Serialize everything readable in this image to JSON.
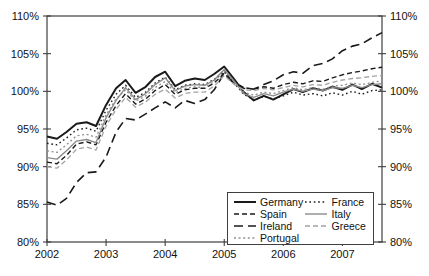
{
  "figure": {
    "width": 429,
    "height": 276,
    "background": "#ffffff"
  },
  "chart_data": {
    "type": "line",
    "title": "",
    "xlabel": "",
    "ylabel": "",
    "grid": false,
    "xlim": [
      2002,
      2007.67
    ],
    "ylim": [
      80,
      110
    ],
    "xticks": {
      "values": [
        2002,
        2003,
        2004,
        2005,
        2006,
        2007
      ],
      "labels": [
        "2002",
        "2003",
        "2004",
        "2005",
        "2006",
        "2007"
      ]
    },
    "yticks": {
      "values": [
        80,
        85,
        90,
        95,
        100,
        105,
        110
      ],
      "labels": [
        "80%",
        "85%",
        "90%",
        "95%",
        "100%",
        "105%",
        "110%"
      ],
      "sides": [
        "left",
        "right"
      ]
    },
    "axis_color": "#3f3f3f",
    "label_color": "#111111",
    "x": [
      2002.0,
      2002.17,
      2002.33,
      2002.5,
      2002.67,
      2002.83,
      2003.0,
      2003.17,
      2003.33,
      2003.5,
      2003.67,
      2003.83,
      2004.0,
      2004.17,
      2004.33,
      2004.5,
      2004.67,
      2004.83,
      2005.0,
      2005.17,
      2005.33,
      2005.5,
      2005.67,
      2005.83,
      2006.0,
      2006.17,
      2006.33,
      2006.5,
      2006.67,
      2006.83,
      2007.0,
      2007.17,
      2007.33,
      2007.5,
      2007.67
    ],
    "series": [
      {
        "name": "Germany",
        "color": "#1a1a1a",
        "dash": "",
        "width": 2.0,
        "values": [
          94.0,
          93.7,
          94.6,
          95.7,
          95.9,
          95.4,
          98.2,
          100.4,
          101.5,
          99.8,
          100.6,
          101.9,
          102.6,
          100.7,
          101.4,
          101.7,
          101.5,
          102.3,
          103.3,
          101.6,
          99.9,
          98.8,
          99.4,
          98.9,
          99.6,
          100.3,
          99.9,
          100.4,
          100.1,
          100.6,
          100.2,
          100.9,
          100.3,
          101.0,
          100.5
        ]
      },
      {
        "name": "Spain",
        "color": "#1a1a1a",
        "dash": "5,3",
        "width": 1.4,
        "values": [
          90.6,
          90.4,
          91.5,
          93.0,
          93.3,
          92.9,
          95.9,
          98.1,
          99.7,
          98.3,
          99.0,
          100.1,
          100.9,
          99.6,
          100.2,
          100.4,
          100.4,
          101.1,
          102.4,
          101.2,
          100.5,
          100.3,
          100.6,
          100.4,
          100.9,
          101.2,
          101.0,
          101.4,
          101.3,
          101.8,
          102.2,
          102.5,
          102.7,
          103.0,
          103.2
        ]
      },
      {
        "name": "Ireland",
        "color": "#1a1a1a",
        "dash": "9,5",
        "width": 1.6,
        "values": [
          85.3,
          84.9,
          85.8,
          87.9,
          89.2,
          89.3,
          91.3,
          94.6,
          96.4,
          96.2,
          97.0,
          97.8,
          98.6,
          97.8,
          98.8,
          98.4,
          98.9,
          100.2,
          102.4,
          101.0,
          100.4,
          100.3,
          100.9,
          101.4,
          102.2,
          102.6,
          102.4,
          103.4,
          103.7,
          104.3,
          105.4,
          106.0,
          106.3,
          107.1,
          107.8
        ]
      },
      {
        "name": "Portugal",
        "color": "#8f8f8f",
        "dash": "2,2.6",
        "width": 1.3,
        "values": [
          92.1,
          91.9,
          92.9,
          94.1,
          94.3,
          93.9,
          96.9,
          99.0,
          100.2,
          98.7,
          99.4,
          100.5,
          101.3,
          99.8,
          100.4,
          100.6,
          100.5,
          101.3,
          102.7,
          101.2,
          99.9,
          99.5,
          99.9,
          99.7,
          100.1,
          100.5,
          100.2,
          100.5,
          100.3,
          100.7,
          100.8,
          101.1,
          100.9,
          101.2,
          101.4
        ]
      },
      {
        "name": "France",
        "color": "#1a1a1a",
        "dash": "1.6,2.8",
        "width": 1.4,
        "values": [
          93.1,
          92.9,
          93.8,
          94.9,
          95.1,
          94.7,
          97.5,
          99.6,
          100.8,
          99.2,
          99.9,
          101.1,
          101.9,
          100.2,
          100.8,
          101.0,
          100.9,
          101.6,
          102.6,
          101.1,
          99.6,
          98.9,
          99.3,
          99.0,
          99.4,
          99.9,
          99.5,
          99.7,
          99.4,
          99.8,
          99.5,
          100.0,
          99.6,
          100.1,
          100.2
        ]
      },
      {
        "name": "Italy",
        "color": "#8c8c8c",
        "dash": "",
        "width": 1.4,
        "values": [
          91.2,
          91.0,
          92.1,
          93.4,
          93.6,
          93.2,
          96.5,
          98.8,
          100.5,
          98.9,
          99.7,
          100.9,
          101.8,
          100.1,
          100.7,
          100.9,
          100.8,
          101.5,
          102.9,
          101.3,
          99.7,
          99.2,
          99.7,
          99.4,
          99.9,
          100.3,
          100.0,
          100.3,
          100.1,
          100.5,
          100.4,
          100.8,
          100.5,
          100.9,
          101.0
        ]
      },
      {
        "name": "Greece",
        "color": "#a3a3a3",
        "dash": "5,3",
        "width": 1.3,
        "values": [
          90.0,
          89.8,
          90.9,
          92.3,
          92.6,
          92.2,
          95.4,
          97.6,
          99.2,
          97.9,
          98.6,
          99.6,
          100.3,
          99.1,
          99.7,
          99.9,
          99.9,
          100.7,
          102.1,
          100.9,
          100.2,
          100.1,
          100.4,
          100.2,
          100.5,
          100.8,
          100.6,
          100.9,
          100.8,
          101.2,
          101.5,
          101.7,
          101.8,
          102.0,
          102.1
        ]
      }
    ],
    "legend": {
      "position": "inside-bottom-right",
      "columns": [
        [
          "Germany",
          "Spain",
          "Ireland",
          "Portugal"
        ],
        [
          "France",
          "Italy",
          "Greece"
        ]
      ]
    }
  }
}
